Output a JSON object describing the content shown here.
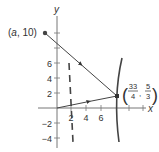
{
  "figure": {
    "axes": {
      "x_label": "x",
      "y_label": "y",
      "x_ticks": [
        "2",
        "4",
        "6"
      ],
      "y_ticks": [
        "6",
        "4",
        "2",
        "−2",
        "−4"
      ]
    },
    "points": {
      "start": {
        "label_open": "(",
        "label_var": "a",
        "label_rest": ", 10)"
      },
      "reflection": {
        "x_num": "33",
        "x_den": "4",
        "y_num": "5",
        "y_den": "3"
      }
    },
    "colors": {
      "stroke": "#444444",
      "axis": "#666666",
      "text": "#333333"
    }
  }
}
